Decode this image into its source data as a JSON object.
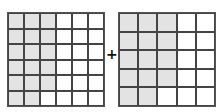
{
  "operator": "+",
  "colors": {
    "shaded": "#e3e3e3",
    "unshaded": "#ffffff",
    "line": "#444444"
  },
  "left_grid": {
    "rows": 6,
    "cols": 6,
    "shaded": [
      [
        1,
        1,
        1,
        0,
        0,
        0
      ],
      [
        1,
        1,
        1,
        0,
        0,
        0
      ],
      [
        1,
        1,
        1,
        0,
        0,
        0
      ],
      [
        1,
        1,
        1,
        0,
        0,
        0
      ],
      [
        1,
        1,
        1,
        0,
        0,
        0
      ],
      [
        1,
        1,
        0,
        0,
        0,
        0
      ]
    ],
    "shaded_count": 17,
    "total": 36
  },
  "right_grid": {
    "rows": 5,
    "cols": 5,
    "shaded": [
      [
        1,
        1,
        1,
        0,
        0
      ],
      [
        1,
        1,
        1,
        0,
        0
      ],
      [
        1,
        1,
        1,
        0,
        0
      ],
      [
        1,
        1,
        1,
        0,
        0
      ],
      [
        1,
        1,
        0,
        0,
        0
      ]
    ],
    "shaded_count": 14,
    "total": 25
  }
}
